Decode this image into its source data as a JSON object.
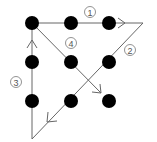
{
  "diagram": {
    "colors": {
      "dot": "#000000",
      "line": "#666666",
      "label": "#555555",
      "background": "#ffffff"
    },
    "dots": [
      {
        "x": 32,
        "y": 23
      },
      {
        "x": 71,
        "y": 23
      },
      {
        "x": 109,
        "y": 23
      },
      {
        "x": 32,
        "y": 62
      },
      {
        "x": 71,
        "y": 62
      },
      {
        "x": 109,
        "y": 62
      },
      {
        "x": 32,
        "y": 101
      },
      {
        "x": 71,
        "y": 101
      },
      {
        "x": 109,
        "y": 101
      }
    ],
    "strokes": [
      {
        "step": "1",
        "from": [
          32,
          23
        ],
        "to": [
          143,
          23
        ],
        "arrow_at": [
          124,
          23
        ],
        "label_pos": [
          90,
          12
        ]
      },
      {
        "step": "2",
        "from": [
          143,
          23
        ],
        "to": [
          32,
          139
        ],
        "arrow_at": [
          50,
          120
        ],
        "label_pos": [
          130,
          50
        ]
      },
      {
        "step": "3",
        "from": [
          32,
          139
        ],
        "to": [
          32,
          23
        ],
        "arrow_at": [
          32,
          43
        ],
        "label_pos": [
          16,
          82
        ]
      },
      {
        "step": "4",
        "from": [
          32,
          23
        ],
        "to": [
          101,
          92
        ],
        "arrow_at": [
          99,
          90
        ],
        "label_pos": [
          71,
          43
        ]
      }
    ],
    "labels": [
      "1",
      "2",
      "3",
      "4"
    ]
  }
}
